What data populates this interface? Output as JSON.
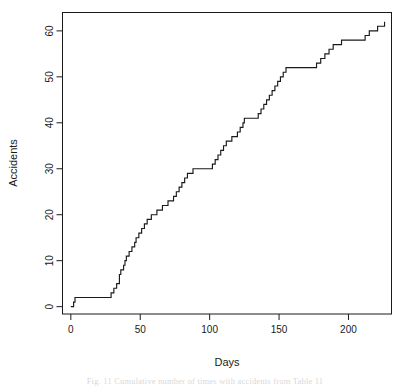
{
  "figure": {
    "caption": "Fig. 11   Cumulative number of times with accidents from Table 11",
    "background": "#ffffff",
    "line_color": "#1a1a1a",
    "axis_color": "#1a1a1a"
  },
  "chart_data": {
    "type": "line",
    "subtype": "step",
    "title": "",
    "subtitle": "",
    "xlabel": "Days",
    "ylabel": "Accidents",
    "xlim": [
      -6,
      231
    ],
    "ylim": [
      -1.6,
      64
    ],
    "xticks": [
      0,
      50,
      100,
      150,
      200
    ],
    "yticks": [
      0,
      10,
      20,
      30,
      40,
      50,
      60
    ],
    "grid": false,
    "legend": null,
    "box": true,
    "series": [
      {
        "name": "Cumulative accidents",
        "step_mode": "post",
        "x": [
          0,
          2,
          3,
          27,
          29,
          31,
          33,
          35,
          36,
          38,
          39,
          40,
          42,
          44,
          46,
          47,
          49,
          51,
          53,
          55,
          57,
          58,
          60,
          62,
          64,
          66,
          68,
          70,
          72,
          74,
          76,
          78,
          80,
          82,
          84,
          86,
          88,
          100,
          102,
          104,
          106,
          108,
          110,
          112,
          114,
          116,
          118,
          120,
          122,
          124,
          125,
          133,
          135,
          137,
          139,
          141,
          143,
          145,
          147,
          149,
          151,
          153,
          155,
          175,
          177,
          180,
          183,
          186,
          189,
          192,
          195,
          197,
          212,
          215,
          218,
          221,
          224,
          226
        ],
        "y": [
          0,
          1,
          2,
          2,
          3,
          4,
          5,
          7,
          8,
          9,
          10,
          11,
          12,
          13,
          14,
          15,
          16,
          17,
          18,
          19,
          19,
          20,
          20,
          21,
          21,
          22,
          22,
          23,
          23,
          24,
          25,
          26,
          27,
          28,
          29,
          29,
          30,
          30,
          31,
          32,
          33,
          34,
          35,
          36,
          36,
          37,
          37,
          38,
          39,
          40,
          41,
          41,
          42,
          43,
          44,
          45,
          46,
          47,
          48,
          49,
          50,
          51,
          52,
          52,
          53,
          54,
          55,
          56,
          57,
          57,
          58,
          58,
          59,
          60,
          60,
          61,
          61,
          62
        ]
      }
    ],
    "annotations": []
  },
  "axes": {
    "x_tick_labels": [
      "0",
      "50",
      "100",
      "150",
      "200"
    ],
    "y_tick_labels": [
      "0",
      "10",
      "20",
      "30",
      "40",
      "50",
      "60"
    ],
    "x_axis_title": "Days",
    "y_axis_title": "Accidents"
  }
}
